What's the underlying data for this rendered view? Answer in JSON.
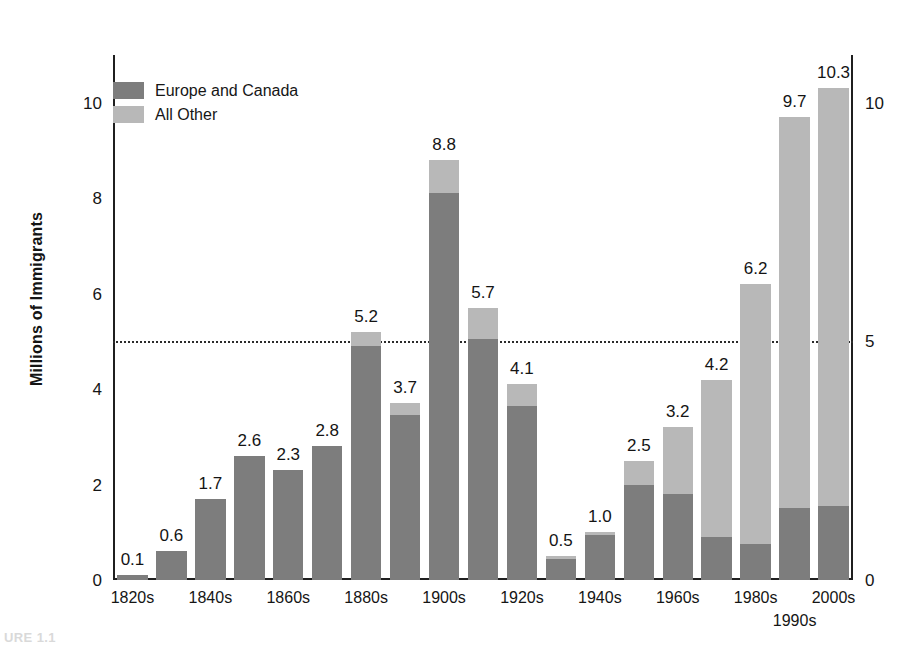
{
  "figure": {
    "caption": "URE 1.1"
  },
  "legend": {
    "position": "top-left",
    "items": [
      {
        "label": "Europe and Canada",
        "color": "#7d7d7d",
        "swatch": "dark"
      },
      {
        "label": "All Other",
        "color": "#b8b8b8",
        "swatch": "light"
      }
    ]
  },
  "axes": {
    "ylabel": "Millions of Immigrants",
    "left_ticks": [
      "0",
      "2",
      "4",
      "6",
      "8",
      "10"
    ],
    "left_tick_values": [
      0,
      2,
      4,
      6,
      8,
      10
    ],
    "right_ticks": [
      "0",
      "5",
      "10"
    ],
    "right_tick_values": [
      0,
      5,
      10
    ],
    "reference_line_value": 5,
    "ylim": [
      0,
      11.0
    ]
  },
  "chart_data": {
    "type": "bar",
    "stacked": true,
    "title": "",
    "xlabel": "",
    "ylabel": "Millions of Immigrants",
    "ylim": [
      0,
      11.0
    ],
    "grid": false,
    "legend_position": "top-left",
    "categories": [
      "1820s",
      "1830s",
      "1840s",
      "1850s",
      "1860s",
      "1870s",
      "1880s",
      "1890s",
      "1900s",
      "1910s",
      "1920s",
      "1930s",
      "1940s",
      "1950s",
      "1960s",
      "1970s",
      "1980s",
      "1990s",
      "2000s"
    ],
    "tick_labels": [
      "1820s",
      "",
      "1840s",
      "",
      "1860s",
      "",
      "1880s",
      "",
      "1900s",
      "",
      "1920s",
      "",
      "1940s",
      "",
      "1960s",
      "",
      "1980s",
      "1990s",
      "2000s"
    ],
    "totals": [
      0.1,
      0.6,
      1.7,
      2.6,
      2.3,
      2.8,
      5.2,
      3.7,
      8.8,
      5.7,
      4.1,
      0.5,
      1.0,
      2.5,
      3.2,
      4.2,
      6.2,
      9.7,
      10.3
    ],
    "series": [
      {
        "name": "Europe and Canada",
        "color": "#7d7d7d",
        "values": [
          0.1,
          0.6,
          1.7,
          2.6,
          2.3,
          2.8,
          4.9,
          3.45,
          8.1,
          5.05,
          3.65,
          0.45,
          0.95,
          2.0,
          1.8,
          0.9,
          0.75,
          1.5,
          1.55
        ]
      },
      {
        "name": "All Other",
        "color": "#b8b8b8",
        "values": [
          0.0,
          0.0,
          0.0,
          0.0,
          0.0,
          0.0,
          0.3,
          0.25,
          0.7,
          0.65,
          0.45,
          0.05,
          0.05,
          0.5,
          1.4,
          3.3,
          5.45,
          8.2,
          8.75
        ]
      }
    ],
    "data_labels": [
      "0.1",
      "0.6",
      "1.7",
      "2.6",
      "2.3",
      "2.8",
      "5.2",
      "3.7",
      "8.8",
      "5.7",
      "4.1",
      "0.5",
      "1.0",
      "2.5",
      "3.2",
      "4.2",
      "6.2",
      "9.7",
      "10.3"
    ]
  }
}
